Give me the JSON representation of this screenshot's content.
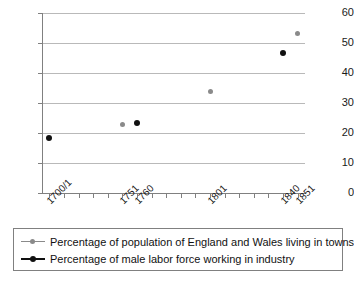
{
  "chart_data": {
    "type": "scatter",
    "title": "",
    "subtitle": "",
    "xlabel": "",
    "ylabel": "",
    "ylim": [
      0,
      60
    ],
    "ytick_values": [
      0,
      10,
      20,
      30,
      40,
      50,
      60
    ],
    "ytick_labels": [
      "0",
      "10",
      "20",
      "30",
      "40",
      "50",
      "60"
    ],
    "grid": "horizontal",
    "legend_position": "bottom",
    "categories": [
      "1700/1",
      "1751",
      "1760",
      "1801",
      "1840",
      "1851"
    ],
    "category_slots": 18,
    "category_slot_index": [
      0,
      5,
      6,
      11,
      16,
      17
    ],
    "series": [
      {
        "name": "Percentage of population of England and Wales living in towns",
        "color": "#8a8a8a",
        "marker": "dot",
        "points": [
          {
            "x": "1700/1",
            "slot": 0,
            "value": null
          },
          {
            "x": "1751",
            "slot": 5,
            "value": 22.8
          },
          {
            "x": "1801",
            "slot": 11,
            "value": 33.8
          },
          {
            "x": "1851",
            "slot": 17,
            "value": 53.3
          }
        ]
      },
      {
        "name": "Percentage of male labor force working in industry",
        "color": "#101010",
        "marker": "dot",
        "points": [
          {
            "x": "1700/1",
            "slot": 0,
            "value": 18.2
          },
          {
            "x": "1760",
            "slot": 6,
            "value": 23.5
          },
          {
            "x": "1840",
            "slot": 16,
            "value": 46.7
          }
        ]
      }
    ]
  },
  "legend": {
    "items": [
      {
        "label": "Percentage of population of England and Wales living in towns"
      },
      {
        "label": "Percentage of male labor force working in industry"
      }
    ]
  }
}
